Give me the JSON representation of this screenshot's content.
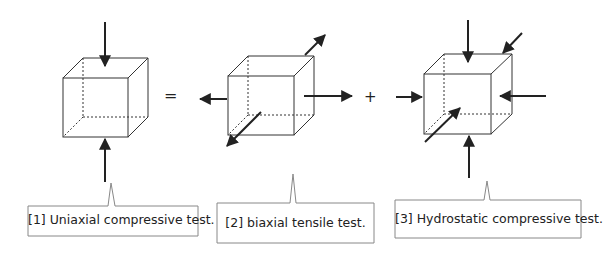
{
  "symbols": {
    "equals": "=",
    "plus": "+"
  },
  "callouts": [
    {
      "label": "[1] Uniaxial compressive test."
    },
    {
      "label": "[2] biaxial tensile test."
    },
    {
      "label": "[3] Hydrostatic compressive test."
    }
  ],
  "colors": {
    "line": "#222222",
    "box": "#888888"
  }
}
